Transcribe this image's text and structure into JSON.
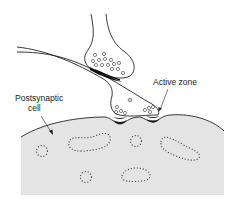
{
  "diagram": {
    "labels": {
      "active_zone": "Active zone",
      "postsynaptic_line1": "Postsynaptic",
      "postsynaptic_line2": "cell"
    },
    "colors": {
      "cell_fill": "#e4e4e4",
      "outline": "#222222",
      "background": "#ffffff",
      "density": "#111111"
    },
    "components": [
      "modulatory-terminal",
      "presynaptic-axon",
      "presynaptic-terminal",
      "active-zones",
      "postsynaptic-cell",
      "organelles"
    ]
  }
}
